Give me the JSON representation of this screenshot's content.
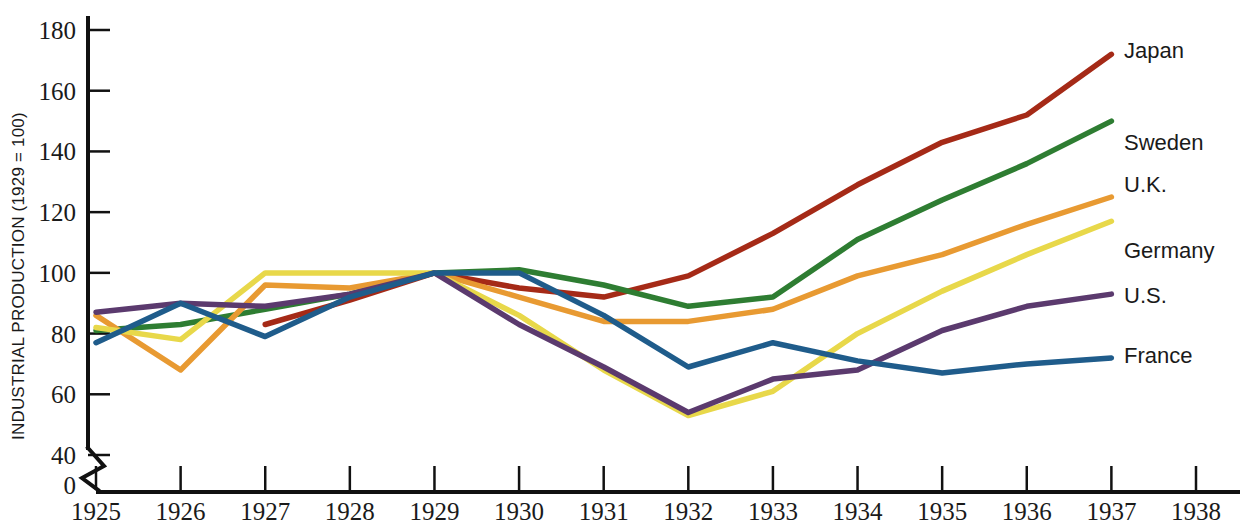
{
  "chart_data": {
    "type": "line",
    "title": "",
    "subtitle": "",
    "xlabel": "",
    "ylabel": "INDUSTRIAL PRODUCTION (1929 = 100)",
    "x": [
      1925,
      1926,
      1927,
      1928,
      1929,
      1930,
      1931,
      1932,
      1933,
      1934,
      1935,
      1936,
      1937,
      1938
    ],
    "xtick_labels": [
      "1925",
      "1926",
      "1927",
      "1928",
      "1929",
      "1930",
      "1931",
      "1932",
      "1933",
      "1934",
      "1935",
      "1936",
      "1937",
      "1938"
    ],
    "ytick_labels": [
      "0",
      "40",
      "60",
      "80",
      "100",
      "120",
      "140",
      "160",
      "180"
    ],
    "ytick_values": [
      0,
      40,
      60,
      80,
      100,
      120,
      140,
      160,
      180
    ],
    "ylim": [
      40,
      180
    ],
    "xlim": [
      1925,
      1938
    ],
    "axis_break": true,
    "axis_break_note": "zigzag break between 0 and 40 on the y-axis",
    "grid": false,
    "legend_position": "right-inline-labels",
    "series": [
      {
        "name": "Japan",
        "color": "#A52A17",
        "x": [
          1927,
          1928,
          1929,
          1930,
          1931,
          1932,
          1933,
          1934,
          1935,
          1936,
          1937
        ],
        "values": [
          83,
          91,
          100,
          95,
          92,
          99,
          113,
          129,
          143,
          152,
          172
        ]
      },
      {
        "name": "Sweden",
        "color": "#2E7D32",
        "x": [
          1925,
          1926,
          1927,
          1928,
          1929,
          1930,
          1931,
          1932,
          1933,
          1934,
          1935,
          1936,
          1937
        ],
        "values": [
          81,
          83,
          88,
          93,
          100,
          101,
          96,
          89,
          92,
          111,
          124,
          136,
          150
        ]
      },
      {
        "name": "U.K.",
        "color": "#E89A32",
        "x": [
          1925,
          1926,
          1927,
          1928,
          1929,
          1930,
          1931,
          1932,
          1933,
          1934,
          1935,
          1936,
          1937
        ],
        "values": [
          86,
          68,
          96,
          95,
          100,
          92,
          84,
          84,
          88,
          99,
          106,
          116,
          125
        ]
      },
      {
        "name": "Germany",
        "color": "#E8D84A",
        "x": [
          1925,
          1926,
          1927,
          1928,
          1929,
          1930,
          1931,
          1932,
          1933,
          1934,
          1935,
          1936,
          1937
        ],
        "values": [
          82,
          78,
          100,
          100,
          100,
          86,
          68,
          53,
          61,
          80,
          94,
          106,
          117
        ]
      },
      {
        "name": "U.S.",
        "color": "#5B3A6E",
        "x": [
          1925,
          1926,
          1927,
          1928,
          1929,
          1930,
          1931,
          1932,
          1933,
          1934,
          1935,
          1936,
          1937
        ],
        "values": [
          87,
          90,
          89,
          93,
          100,
          83,
          69,
          54,
          65,
          68,
          81,
          89,
          93
        ]
      },
      {
        "name": "France",
        "color": "#1F5C8B",
        "x": [
          1925,
          1926,
          1927,
          1928,
          1929,
          1930,
          1931,
          1932,
          1933,
          1934,
          1935,
          1936,
          1937
        ],
        "values": [
          77,
          90,
          79,
          92,
          100,
          100,
          86,
          69,
          77,
          71,
          67,
          70,
          72
        ]
      }
    ],
    "series_labels": [
      {
        "name": "Japan",
        "text": "Japan",
        "value_at_end": 172
      },
      {
        "name": "Sweden",
        "text": "Sweden",
        "value_at_end": 150
      },
      {
        "name": "U.K.",
        "text": "U.K.",
        "value_at_end": 125
      },
      {
        "name": "Germany",
        "text": "Germany",
        "value_at_end": 117
      },
      {
        "name": "U.S.",
        "text": "U.S.",
        "value_at_end": 93
      },
      {
        "name": "France",
        "text": "France",
        "value_at_end": 72
      }
    ]
  }
}
